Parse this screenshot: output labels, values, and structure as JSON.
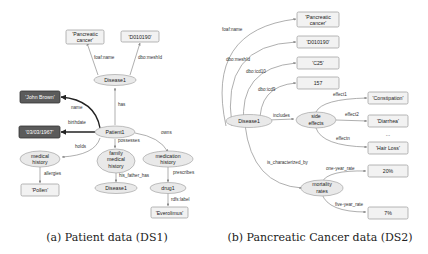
{
  "diagram_a": {
    "caption": "(a) Patient data (DS1)",
    "nodes": {
      "pancreatic_cancer": "'Pancreatic",
      "pancreatic_cancer_2": "cancer'",
      "d010190": "'D010190'",
      "disease1_top": "Disease1",
      "john_brown": "'John Brown'",
      "birthdate": "'03/03/1967'",
      "patient1": "Patient1",
      "medical_history_1": "medical",
      "medical_history_2": "history",
      "family_1": "family",
      "family_2": "medical",
      "family_3": "history",
      "medication_1": "medication",
      "medication_2": "history",
      "pollen": "'Pollen'",
      "disease1_bottom": "Disease1",
      "drug1": "drug1",
      "everolimus": "'Everolimus'"
    },
    "edges": {
      "foaf_name": "foaf:name",
      "dbo_meshid": "dbo:meshId",
      "has": "has",
      "name": "name",
      "birthdate": "birthdate",
      "holds": "holds",
      "possesses": "possesses",
      "owns": "owns",
      "allergies": "allergies",
      "his_father_has": "his_father_has",
      "prescribes": "prescribes",
      "rdfs_label": "rdfs:label"
    }
  },
  "diagram_b": {
    "caption": "(b) Pancreatic Cancer data (DS2)",
    "nodes": {
      "pancreatic_1": "'Pancreatic",
      "pancreatic_2": "cancer'",
      "d010190": "'D010190'",
      "c25": "'C25'",
      "n157": "157",
      "disease1": "Disease1",
      "side_effects_1": "side",
      "side_effects_2": "effects",
      "constipation": "'Constipation'",
      "diarrhea": "'Diarrhea'",
      "ellipsis": "...",
      "hair_loss": "'Hair Loss'",
      "mortality_1": "mortality",
      "mortality_2": "rates",
      "pct20": "20%",
      "pct7": "7%"
    },
    "edges": {
      "foaf_name": "foaf:name",
      "dbo_meshid": "dbo:meshId",
      "dbo_icd10": "dbo:icd10",
      "dbo_icd9": "dbo:icd9",
      "includes": "includes",
      "effect1": "effect1",
      "effect2": "effect2",
      "effectn": "effectn",
      "is_characterized_by": "is_characterized_by",
      "one_year_rate": "one-year_rate",
      "five_year_rate": "five-year_rate"
    }
  }
}
